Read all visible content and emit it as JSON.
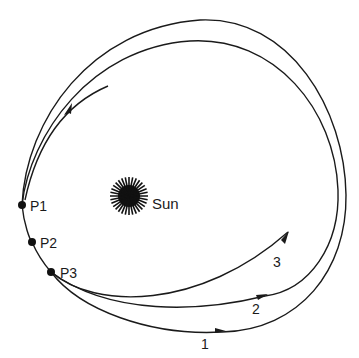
{
  "figure": {
    "sun_label": "Sun",
    "points": [
      {
        "id": "P1",
        "label": "P1"
      },
      {
        "id": "P2",
        "label": "P2"
      },
      {
        "id": "P3",
        "label": "P3"
      }
    ],
    "paths": [
      {
        "id": "1",
        "label": "1"
      },
      {
        "id": "2",
        "label": "2"
      },
      {
        "id": "3",
        "label": "3"
      }
    ],
    "colors": {
      "line": "#1a1a1a",
      "background": "#ffffff"
    }
  }
}
